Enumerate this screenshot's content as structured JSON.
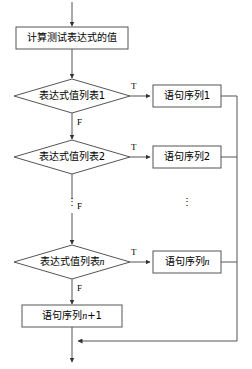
{
  "diagram": {
    "colors": {
      "stroke": "#555555",
      "text": "#000000",
      "background": "#ffffff"
    },
    "nodes": {
      "compute": {
        "label": "计算测试表达式的值",
        "shape": "process"
      },
      "cond1": {
        "label": "表达式值列表1",
        "shape": "decision"
      },
      "cond2": {
        "label": "表达式值列表2",
        "shape": "decision"
      },
      "condn": {
        "label_prefix": "表达式值列表",
        "label_suffix": "n",
        "shape": "decision"
      },
      "stmt1": {
        "label": "语句序列1",
        "shape": "process"
      },
      "stmt2": {
        "label": "语句序列2",
        "shape": "process"
      },
      "stmtn": {
        "label_prefix": "语句序列",
        "label_suffix": "n",
        "shape": "process"
      },
      "stmtn1": {
        "label_prefix": "语句序列",
        "label_suffix": "n",
        "label_tail": "+1",
        "shape": "process"
      }
    },
    "edge_labels": {
      "true1": "T",
      "false1": "F",
      "true2": "T",
      "false2": "F",
      "truen": "T",
      "falsen": "F"
    },
    "ellipsis": {
      "left": "⋮",
      "right": "⋮"
    }
  }
}
